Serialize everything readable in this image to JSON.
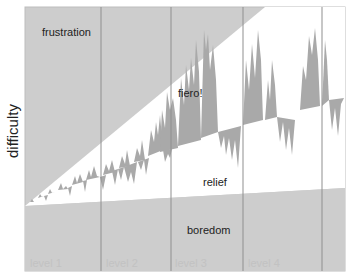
{
  "diagram": {
    "y_axis_label": "difficulty",
    "zones": {
      "frustration": "frustration",
      "fiero": "fiero!",
      "relief": "relief",
      "boredom": "boredom"
    },
    "levels": [
      {
        "label": "level 1"
      },
      {
        "label": "level 2"
      },
      {
        "label": "level 3"
      },
      {
        "label": "level 4"
      }
    ],
    "colors": {
      "zone_fill": "#cdcdcd",
      "spike_fill": "#a9a9a9",
      "divider": "#8f8f8f",
      "flow_channel": "#ffffff",
      "border": "#bdbdbd"
    }
  }
}
